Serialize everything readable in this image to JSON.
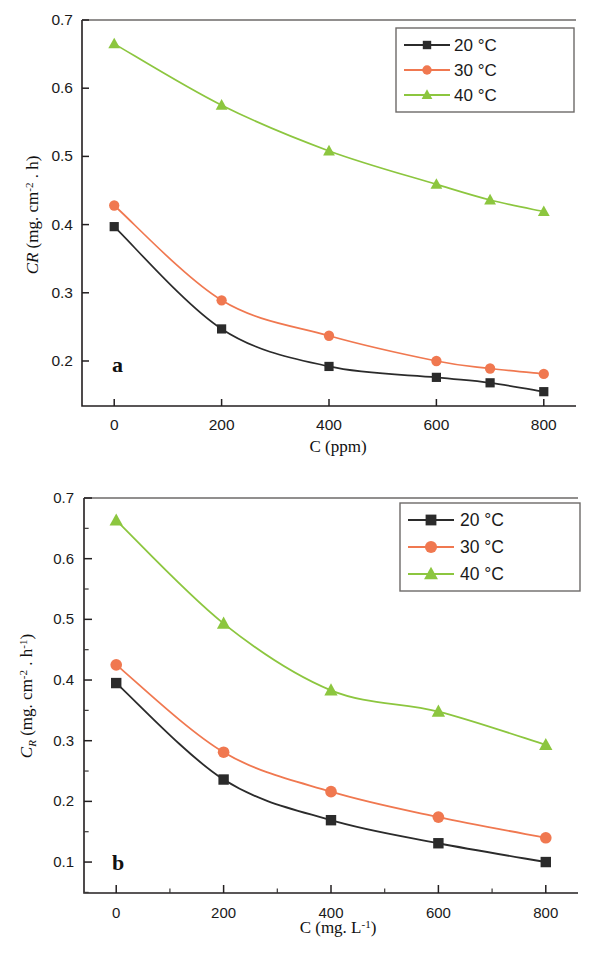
{
  "figure": {
    "panels": [
      {
        "id": "a",
        "letter": "a",
        "xlabel_plain": "C (ppm)",
        "ylabel_plain": "CR (mg. cm-2 . h)",
        "legend_title": "",
        "ylabel_parts": {
          "symbol": "CR",
          "open": " (mg. cm",
          "exp": "-2",
          "mid": " . h)"
        },
        "xlabel_parts": {
          "symbol": "C",
          "unit": " (ppm)"
        },
        "xticks": [
          "0",
          "200",
          "400",
          "600",
          "800"
        ],
        "yticks": [
          "0.2",
          "0.3",
          "0.4",
          "0.5",
          "0.6",
          "0.7"
        ]
      },
      {
        "id": "b",
        "letter": "b",
        "xlabel_plain": "C (mg. L-1)",
        "ylabel_plain": "CR (mg. cm-2 . h-1)",
        "ylabel_parts": {
          "symbol": "C",
          "sub": "R",
          "open": " (mg. cm",
          "exp": "-2",
          "mid": " . h",
          "exp2": "-1",
          "close": ")"
        },
        "xlabel_parts": {
          "symbol": "C",
          "open": " (mg. L",
          "exp": "-1",
          "close": ")"
        },
        "xticks": [
          "0",
          "200",
          "400",
          "600",
          "800"
        ],
        "yticks": [
          "0.1",
          "0.2",
          "0.3",
          "0.4",
          "0.5",
          "0.6",
          "0.7"
        ]
      }
    ],
    "legend_entries": [
      "20 °C",
      "30 °C",
      "40 °C"
    ]
  },
  "colors": {
    "series_20": "#2b2b2b",
    "series_30": "#f07850",
    "series_40": "#8cc63f",
    "axis": "#231f20",
    "frame": "#6d6a68",
    "background": "#ffffff"
  },
  "chart_data": [
    {
      "type": "line",
      "panel": "a",
      "title": "",
      "xlabel": "C (ppm)",
      "ylabel": "CR (mg. cm-2 . h)",
      "x": [
        0,
        200,
        400,
        600,
        700,
        800
      ],
      "xlim": [
        -60,
        860
      ],
      "ylim": [
        0.134,
        0.7
      ],
      "xticks": [
        0,
        200,
        400,
        600,
        800
      ],
      "yticks": [
        0.2,
        0.3,
        0.4,
        0.5,
        0.6,
        0.7
      ],
      "grid": false,
      "legend_position": "top-right",
      "interpolation": "spline",
      "series": [
        {
          "name": "20 °C",
          "marker": "square",
          "color": "#2b2b2b",
          "values": [
            0.397,
            0.247,
            0.192,
            0.176,
            0.168,
            0.155
          ]
        },
        {
          "name": "30 °C",
          "marker": "circle",
          "color": "#f07850",
          "values": [
            0.428,
            0.289,
            0.237,
            0.2,
            0.189,
            0.181
          ]
        },
        {
          "name": "40 °C",
          "marker": "triangle",
          "color": "#8cc63f",
          "values": [
            0.665,
            0.575,
            0.508,
            0.459,
            0.436,
            0.419
          ]
        }
      ]
    },
    {
      "type": "line",
      "panel": "b",
      "title": "",
      "xlabel": "C (mg. L-1)",
      "ylabel": "CR (mg. cm-2 . h-1)",
      "x": [
        0,
        200,
        400,
        600,
        800
      ],
      "xlim": [
        -60,
        860
      ],
      "ylim": [
        0.049,
        0.7
      ],
      "xticks": [
        0,
        200,
        400,
        600,
        800
      ],
      "yticks": [
        0.1,
        0.2,
        0.3,
        0.4,
        0.5,
        0.6,
        0.7
      ],
      "grid": false,
      "legend_position": "top-right",
      "interpolation": "spline",
      "series": [
        {
          "name": "20 °C",
          "marker": "square",
          "color": "#2b2b2b",
          "values": [
            0.395,
            0.236,
            0.169,
            0.131,
            0.1
          ]
        },
        {
          "name": "30 °C",
          "marker": "circle",
          "color": "#f07850",
          "values": [
            0.425,
            0.281,
            0.216,
            0.174,
            0.14
          ]
        },
        {
          "name": "40 °C",
          "marker": "triangle",
          "color": "#8cc63f",
          "values": [
            0.663,
            0.493,
            0.383,
            0.348,
            0.293
          ]
        }
      ]
    }
  ]
}
